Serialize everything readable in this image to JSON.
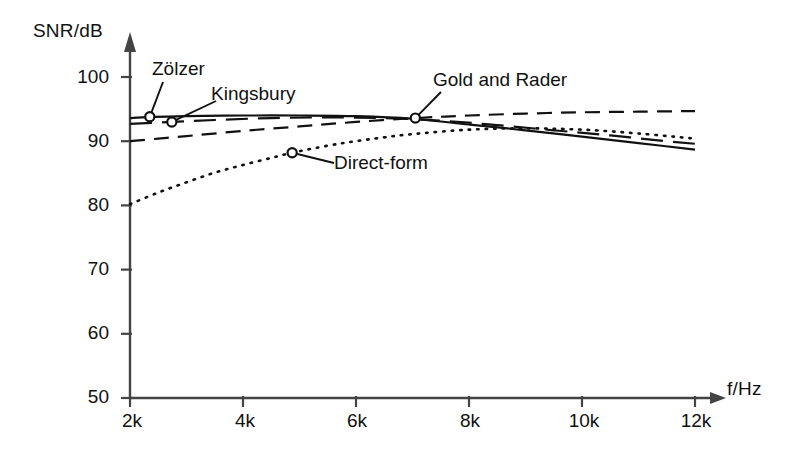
{
  "chart_data": {
    "type": "line",
    "title": "",
    "subtitle": "",
    "xlabel": "f/Hz",
    "ylabel": "SNR/dB",
    "xlim": [
      2000,
      12000
    ],
    "ylim": [
      50,
      100
    ],
    "grid": false,
    "legend_position": "inline-annotations",
    "x_ticks": [
      "2k",
      "4k",
      "6k",
      "8k",
      "10k",
      "12k"
    ],
    "x_tick_values": [
      2000,
      4000,
      6000,
      8000,
      10000,
      12000
    ],
    "y_ticks": [
      "50",
      "60",
      "70",
      "80",
      "90",
      "100"
    ],
    "y_tick_values": [
      50,
      60,
      70,
      80,
      90,
      100
    ],
    "series": [
      {
        "name": "Zölzer",
        "style": "solid",
        "marker_x": 2350,
        "marker_y": 93.8,
        "label_x": 2420,
        "label_y": 100.5,
        "x": [
          2000,
          2350,
          3000,
          4000,
          5000,
          6000,
          7000,
          8000,
          9000,
          10000,
          11000,
          12000
        ],
        "values": [
          93.6,
          93.8,
          93.9,
          94.0,
          94.0,
          93.9,
          93.5,
          92.6,
          91.7,
          90.7,
          89.7,
          88.7
        ]
      },
      {
        "name": "Kingsbury",
        "style": "long-dash",
        "marker_x": 2740,
        "marker_y": 93.0,
        "label_x": 3140,
        "label_y": 97.2,
        "x": [
          2000,
          2740,
          3500,
          4500,
          5500,
          6500,
          7500,
          8500,
          9500,
          10500,
          11500,
          12000
        ],
        "values": [
          92.7,
          93.0,
          93.3,
          93.6,
          93.7,
          93.6,
          93.2,
          92.5,
          91.7,
          90.9,
          90.0,
          89.6
        ]
      },
      {
        "name": "Gold and Rader",
        "style": "dashed",
        "marker_x": 7050,
        "marker_y": 93.6,
        "label_x": 7450,
        "label_y": 99.2,
        "x": [
          2000,
          2500,
          3000,
          4000,
          5000,
          6000,
          7050,
          8000,
          9000,
          10000,
          11000,
          12000
        ],
        "values": [
          90.0,
          90.4,
          90.8,
          91.6,
          92.3,
          93.0,
          93.6,
          94.0,
          94.3,
          94.5,
          94.6,
          94.7
        ]
      },
      {
        "name": "Direct-form",
        "style": "dotted",
        "marker_x": 4870,
        "marker_y": 88.2,
        "label_x": 5660,
        "label_y": 86.0,
        "x": [
          2000,
          2500,
          3000,
          3500,
          4000,
          4500,
          4870,
          5500,
          6000,
          6500,
          7000,
          8000,
          9000,
          10000,
          11000,
          12000
        ],
        "values": [
          80.2,
          82.0,
          83.6,
          85.1,
          86.3,
          87.4,
          88.2,
          89.3,
          90.0,
          90.6,
          91.1,
          91.8,
          92.0,
          91.8,
          91.2,
          90.4
        ]
      }
    ],
    "annotations": [
      {
        "text": "Zölzer",
        "series": "Zölzer"
      },
      {
        "text": "Kingsbury",
        "series": "Kingsbury"
      },
      {
        "text": "Gold and Rader",
        "series": "Gold and Rader"
      },
      {
        "text": "Direct-form",
        "series": "Direct-form"
      }
    ],
    "axis_color": "#444444",
    "line_color": "#111111"
  }
}
